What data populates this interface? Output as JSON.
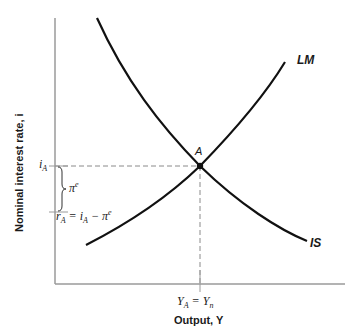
{
  "diagram": {
    "type": "IS-LM",
    "x_axis_label": "Output, Y",
    "y_axis_label": "Nominal interest rate, i",
    "curves": [
      {
        "name": "IS",
        "label": "IS",
        "slope": "downward"
      },
      {
        "name": "LM",
        "label": "LM",
        "slope": "upward"
      }
    ],
    "equilibrium_point": {
      "label": "A"
    },
    "y_ticks": {
      "i_A": "i",
      "i_A_sub": "A",
      "r_A_lhs": "r",
      "r_A_lhs_sub": "A",
      "r_A_eq": " = ",
      "r_A_rhs_i": "i",
      "r_A_rhs_i_sub": "A",
      "r_A_minus": " − ",
      "r_A_rhs_pi": "π",
      "r_A_rhs_pi_sup": "e"
    },
    "brace_label": {
      "symbol": "π",
      "sup": "e"
    },
    "x_tick": {
      "lhs": "Y",
      "lhs_sub": "A",
      "eq": " = ",
      "rhs": "Y",
      "rhs_sub": "n"
    },
    "colors": {
      "axis": "#9a9a9a",
      "curve": "#111111",
      "dashed": "#8a8a8a",
      "text": "#1a1a1a"
    }
  }
}
